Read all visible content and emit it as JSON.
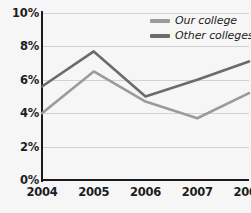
{
  "chart_data": {
    "type": "line",
    "title": "",
    "subtitle": "",
    "xlabel": "",
    "ylabel": "",
    "categories": [
      "2004",
      "2005",
      "2006",
      "2007",
      "2008"
    ],
    "series": [
      {
        "name": "Our college",
        "color": "#9b9b9b",
        "values": [
          4.0,
          6.5,
          4.7,
          3.7,
          5.2
        ]
      },
      {
        "name": "Other colleges",
        "color": "#6b6b6b",
        "values": [
          5.6,
          7.7,
          5.0,
          6.0,
          7.1
        ]
      }
    ],
    "ylim": [
      0,
      10
    ],
    "ytick_values": [
      10,
      8,
      6,
      4,
      2,
      0
    ],
    "ytick_labels": [
      "10%",
      "8%",
      "6%",
      "4%",
      "2%",
      "0%"
    ],
    "grid": true,
    "legend_position": "top-right",
    "axis_color": "#1b1b1b",
    "grid_color": "#d2d2d2",
    "background_color": "#f6f6f6"
  },
  "legend": {
    "items": [
      {
        "label": "Our college",
        "color": "#9b9b9b"
      },
      {
        "label": "Other colleges",
        "color": "#6b6b6b"
      }
    ]
  }
}
